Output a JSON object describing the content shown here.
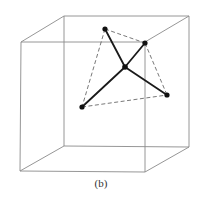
{
  "caption": "(b)",
  "cube": {
    "front": [
      [
        21,
        42
      ],
      [
        145,
        42
      ],
      [
        145,
        172
      ],
      [
        20,
        171
      ]
    ],
    "back": [
      [
        64,
        16
      ],
      [
        189,
        16
      ],
      [
        189,
        147
      ],
      [
        64,
        146
      ]
    ]
  },
  "atoms": {
    "center": [
      125,
      67
    ],
    "top": [
      105,
      29
    ],
    "upper_right": [
      145,
      43
    ],
    "right": [
      167,
      95
    ],
    "bottom_left": [
      82,
      107
    ]
  },
  "bonds": [
    [
      "center",
      "top"
    ],
    [
      "center",
      "upper_right"
    ],
    [
      "center",
      "right"
    ],
    [
      "center",
      "bottom_left"
    ]
  ],
  "tetrahedron_edges": [
    [
      "top",
      "upper_right"
    ],
    [
      "top",
      "bottom_left"
    ],
    [
      "upper_right",
      "right"
    ],
    [
      "bottom_left",
      "right"
    ]
  ],
  "colors": {
    "cube_edge": "#8a8a8a",
    "bond": "#1a1a1a",
    "dashed": "#555555",
    "atom": "#111111"
  }
}
